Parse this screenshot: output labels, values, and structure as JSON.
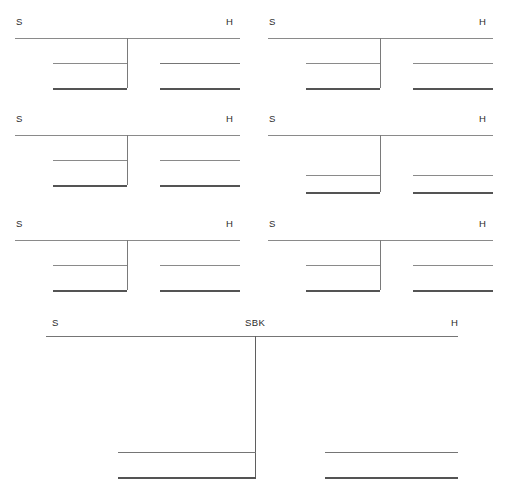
{
  "figure": {
    "type": "diagram",
    "title": "",
    "background_color": "#ffffff",
    "line_color": "#6e6e6e",
    "label_color": "#2b2b2b",
    "width": 506,
    "height": 495,
    "panel_count": 7
  },
  "labels": {
    "s": "S",
    "h": "H",
    "sbk": "SBK"
  },
  "panels": [
    {
      "id": "panel-1",
      "position": "top-left",
      "labels": {
        "left": "S",
        "right": "H"
      },
      "left_label_x": 16,
      "right_label_x": 226,
      "label_y": 17,
      "baseline_y": 38,
      "divider_x": 127,
      "divider_top": 38,
      "divider_bottom": 88,
      "baseline": {
        "x1": 15,
        "x2": 240,
        "weight": "thin"
      },
      "segments": [
        {
          "side": "left",
          "x1": 53,
          "x2": 127,
          "y": 63,
          "weight": "thin"
        },
        {
          "side": "left",
          "x1": 53,
          "x2": 127,
          "y": 88,
          "weight": "thick"
        },
        {
          "side": "right",
          "x1": 160,
          "x2": 240,
          "y": 63,
          "weight": "med"
        },
        {
          "side": "right",
          "x1": 160,
          "x2": 240,
          "y": 88,
          "weight": "thick"
        }
      ]
    },
    {
      "id": "panel-2",
      "position": "top-right",
      "labels": {
        "left": "S",
        "right": "H"
      },
      "left_label_x": 16,
      "right_label_x": 226,
      "label_y": 17,
      "baseline_y": 38,
      "divider_x": 127,
      "divider_top": 38,
      "divider_bottom": 88,
      "baseline": {
        "x1": 15,
        "x2": 240,
        "weight": "thin"
      },
      "segments": [
        {
          "side": "left",
          "x1": 53,
          "x2": 127,
          "y": 63,
          "weight": "thin"
        },
        {
          "side": "left",
          "x1": 53,
          "x2": 127,
          "y": 88,
          "weight": "thick"
        },
        {
          "side": "right",
          "x1": 160,
          "x2": 240,
          "y": 63,
          "weight": "thin"
        },
        {
          "side": "right",
          "x1": 160,
          "x2": 240,
          "y": 88,
          "weight": "thick"
        }
      ]
    },
    {
      "id": "panel-3",
      "position": "middle-left",
      "labels": {
        "left": "S",
        "right": "H"
      },
      "left_label_x": 16,
      "right_label_x": 226,
      "label_y": 17,
      "baseline_y": 38,
      "divider_x": 127,
      "divider_top": 38,
      "divider_bottom": 88,
      "baseline": {
        "x1": 15,
        "x2": 240,
        "weight": "thin"
      },
      "segments": [
        {
          "side": "left",
          "x1": 53,
          "x2": 127,
          "y": 63,
          "weight": "thin"
        },
        {
          "side": "left",
          "x1": 53,
          "x2": 127,
          "y": 88,
          "weight": "thick"
        },
        {
          "side": "right",
          "x1": 160,
          "x2": 240,
          "y": 63,
          "weight": "thin"
        },
        {
          "side": "right",
          "x1": 160,
          "x2": 240,
          "y": 88,
          "weight": "thick"
        }
      ]
    },
    {
      "id": "panel-4",
      "position": "middle-right",
      "labels": {
        "left": "S",
        "right": "H"
      },
      "left_label_x": 16,
      "right_label_x": 226,
      "label_y": 17,
      "baseline_y": 38,
      "divider_x": 127,
      "divider_top": 38,
      "divider_bottom": 95,
      "baseline": {
        "x1": 15,
        "x2": 240,
        "weight": "thin"
      },
      "segments": [
        {
          "side": "left",
          "x1": 53,
          "x2": 127,
          "y": 78,
          "weight": "thin"
        },
        {
          "side": "left",
          "x1": 53,
          "x2": 127,
          "y": 95,
          "weight": "thick"
        },
        {
          "side": "right",
          "x1": 160,
          "x2": 240,
          "y": 78,
          "weight": "thin"
        },
        {
          "side": "right",
          "x1": 160,
          "x2": 240,
          "y": 95,
          "weight": "thick"
        }
      ]
    },
    {
      "id": "panel-5",
      "position": "bottom-row-left",
      "labels": {
        "left": "S",
        "right": "H"
      },
      "left_label_x": 16,
      "right_label_x": 226,
      "label_y": 17,
      "baseline_y": 38,
      "divider_x": 127,
      "divider_top": 38,
      "divider_bottom": 88,
      "baseline": {
        "x1": 15,
        "x2": 240,
        "weight": "thin"
      },
      "segments": [
        {
          "side": "left",
          "x1": 53,
          "x2": 127,
          "y": 63,
          "weight": "thin"
        },
        {
          "side": "left",
          "x1": 53,
          "x2": 127,
          "y": 88,
          "weight": "thick"
        },
        {
          "side": "right",
          "x1": 160,
          "x2": 240,
          "y": 63,
          "weight": "thin"
        },
        {
          "side": "right",
          "x1": 160,
          "x2": 240,
          "y": 88,
          "weight": "thick"
        }
      ]
    },
    {
      "id": "panel-6",
      "position": "bottom-row-right",
      "labels": {
        "left": "S",
        "right": "H"
      },
      "left_label_x": 16,
      "right_label_x": 226,
      "label_y": 17,
      "baseline_y": 38,
      "divider_x": 127,
      "divider_top": 38,
      "divider_bottom": 88,
      "baseline": {
        "x1": 15,
        "x2": 240,
        "weight": "thin"
      },
      "segments": [
        {
          "side": "left",
          "x1": 53,
          "x2": 127,
          "y": 63,
          "weight": "thin"
        },
        {
          "side": "left",
          "x1": 53,
          "x2": 127,
          "y": 88,
          "weight": "thick"
        },
        {
          "side": "right",
          "x1": 160,
          "x2": 240,
          "y": 63,
          "weight": "thin"
        },
        {
          "side": "right",
          "x1": 160,
          "x2": 240,
          "y": 88,
          "weight": "thick"
        }
      ]
    }
  ],
  "large_panel": {
    "id": "panel-7",
    "position": "bottom-full-width",
    "labels": {
      "left": "S",
      "center": "SBK",
      "right": "H"
    },
    "left_label_x": 52,
    "center_label_x": 245,
    "right_label_x": 451,
    "label_y": 318,
    "baseline_y": 336,
    "baseline": {
      "x1": 46,
      "x2": 458,
      "weight": "med"
    },
    "divider_x": 255,
    "divider_top": 336,
    "divider_bottom": 477,
    "segments": [
      {
        "side": "left",
        "x1": 118,
        "x2": 256,
        "y": 452,
        "weight": "med"
      },
      {
        "side": "left",
        "x1": 118,
        "x2": 256,
        "y": 477,
        "weight": "thick"
      },
      {
        "side": "right",
        "x1": 325,
        "x2": 458,
        "y": 452,
        "weight": "med"
      },
      {
        "side": "right",
        "x1": 325,
        "x2": 458,
        "y": 477,
        "weight": "thick"
      }
    ]
  }
}
